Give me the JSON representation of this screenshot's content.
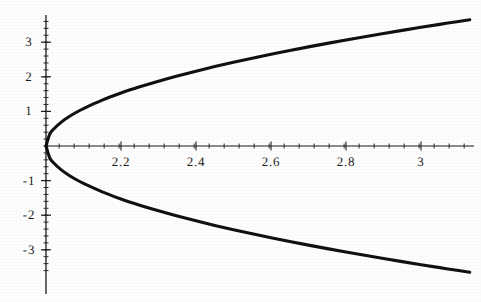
{
  "figure": {
    "background_color": "#fefefe",
    "ink_color": "#111111",
    "axis_color": "#1a1a1a",
    "curve_width_px": 3.1
  },
  "chart_data": {
    "type": "line",
    "title": "",
    "subtitle": "",
    "xlabel": "",
    "ylabel": "",
    "grid": false,
    "legend": false,
    "legend_position": "none",
    "xlim": [
      1.955,
      3.135
    ],
    "ylim": [
      -3.72,
      3.72
    ],
    "x_axis": {
      "tick_labels": [
        "2.2",
        "2.4",
        "2.6",
        "2.8",
        "3"
      ],
      "tick_values": [
        2.2,
        2.4,
        2.6,
        2.8,
        3.0
      ],
      "minor_tick_step": 0.04,
      "axis_position_y": 0
    },
    "y_axis": {
      "tick_labels": [
        "3",
        "2",
        "1",
        "-1",
        "-2",
        "-3"
      ],
      "tick_values": [
        3,
        2,
        1,
        -1,
        -2,
        -3
      ],
      "minor_tick_step": 0.2,
      "axis_position_x": 2.0
    },
    "equation": "y^2 = 11.7 (x - 2)",
    "series": [
      {
        "name": "upper-branch",
        "x": [
          2.0,
          2.01,
          2.02,
          2.04,
          2.06,
          2.08,
          2.1,
          2.15,
          2.2,
          2.25,
          2.3,
          2.35,
          2.4,
          2.45,
          2.5,
          2.55,
          2.6,
          2.65,
          2.7,
          2.75,
          2.8,
          2.85,
          2.9,
          2.95,
          3.0,
          3.05,
          3.1,
          3.13
        ],
        "y": [
          0.0,
          0.342,
          0.484,
          0.684,
          0.838,
          0.968,
          1.082,
          1.325,
          1.53,
          1.71,
          1.873,
          2.023,
          2.163,
          2.295,
          2.419,
          2.538,
          2.651,
          2.76,
          2.865,
          2.966,
          3.064,
          3.159,
          3.252,
          3.342,
          3.43,
          3.516,
          3.6,
          3.65
        ]
      },
      {
        "name": "lower-branch",
        "x": [
          2.0,
          2.01,
          2.02,
          2.04,
          2.06,
          2.08,
          2.1,
          2.15,
          2.2,
          2.25,
          2.3,
          2.35,
          2.4,
          2.45,
          2.5,
          2.55,
          2.6,
          2.65,
          2.7,
          2.75,
          2.8,
          2.85,
          2.9,
          2.95,
          3.0,
          3.05,
          3.1,
          3.13
        ],
        "y": [
          0.0,
          -0.342,
          -0.484,
          -0.684,
          -0.838,
          -0.968,
          -1.082,
          -1.325,
          -1.53,
          -1.71,
          -1.873,
          -2.023,
          -2.163,
          -2.295,
          -2.419,
          -2.538,
          -2.651,
          -2.76,
          -2.865,
          -2.966,
          -3.064,
          -3.159,
          -3.252,
          -3.342,
          -3.43,
          -3.516,
          -3.6,
          -3.65
        ]
      }
    ]
  },
  "pixel_geometry": {
    "origin_x_px": 46,
    "origin_y_px": 146,
    "px_per_x_unit": 375,
    "px_per_y_unit": 34.6,
    "y_axis_top_px": 15,
    "y_axis_bottom_px": 294,
    "x_axis_right_px": 474
  }
}
